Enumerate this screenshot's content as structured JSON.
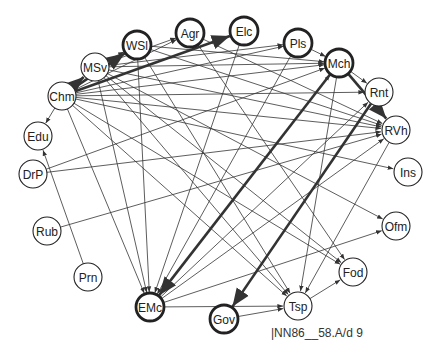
{
  "caption": "|NN86__58.A/d 9",
  "nodes": [
    {
      "id": "Chm",
      "x": 62,
      "y": 96,
      "bold": false
    },
    {
      "id": "MSv",
      "x": 95,
      "y": 67,
      "bold": false
    },
    {
      "id": "WSl",
      "x": 137,
      "y": 45,
      "bold": true
    },
    {
      "id": "Agr",
      "x": 190,
      "y": 33,
      "bold": true
    },
    {
      "id": "Elc",
      "x": 244,
      "y": 31,
      "bold": true
    },
    {
      "id": "Pls",
      "x": 298,
      "y": 43,
      "bold": true
    },
    {
      "id": "Mch",
      "x": 339,
      "y": 63,
      "bold": true
    },
    {
      "id": "Rnt",
      "x": 379,
      "y": 92,
      "bold": false
    },
    {
      "id": "RVh",
      "x": 396,
      "y": 130,
      "bold": false
    },
    {
      "id": "Ins",
      "x": 408,
      "y": 172,
      "bold": false
    },
    {
      "id": "Ofm",
      "x": 396,
      "y": 226,
      "bold": false
    },
    {
      "id": "Fod",
      "x": 353,
      "y": 272,
      "bold": false
    },
    {
      "id": "Tsp",
      "x": 298,
      "y": 306,
      "bold": false
    },
    {
      "id": "Gov",
      "x": 224,
      "y": 319,
      "bold": true
    },
    {
      "id": "EMc",
      "x": 150,
      "y": 307,
      "bold": true
    },
    {
      "id": "Prn",
      "x": 88,
      "y": 277,
      "bold": false
    },
    {
      "id": "Rub",
      "x": 47,
      "y": 231,
      "bold": false
    },
    {
      "id": "DrP",
      "x": 33,
      "y": 174,
      "bold": false
    },
    {
      "id": "Edu",
      "x": 38,
      "y": 136,
      "bold": false
    }
  ],
  "edges": [
    {
      "from": "Chm",
      "to": "MSv",
      "bold": true
    },
    {
      "from": "Chm",
      "to": "WSl",
      "bold": true
    },
    {
      "from": "Chm",
      "to": "Elc",
      "bold": true
    },
    {
      "from": "Chm",
      "to": "Agr",
      "bold": false
    },
    {
      "from": "Chm",
      "to": "Pls",
      "bold": false
    },
    {
      "from": "Chm",
      "to": "Mch",
      "bold": false
    },
    {
      "from": "Chm",
      "to": "Rnt",
      "bold": false
    },
    {
      "from": "Chm",
      "to": "RVh",
      "bold": false
    },
    {
      "from": "Chm",
      "to": "Ins",
      "bold": false
    },
    {
      "from": "Chm",
      "to": "Fod",
      "bold": false
    },
    {
      "from": "Chm",
      "to": "Tsp",
      "bold": false
    },
    {
      "from": "Chm",
      "to": "EMc",
      "bold": false
    },
    {
      "from": "Chm",
      "to": "Edu",
      "bold": false
    },
    {
      "from": "MSv",
      "to": "WSl",
      "bold": false
    },
    {
      "from": "MSv",
      "to": "Agr",
      "bold": false
    },
    {
      "from": "MSv",
      "to": "Pls",
      "bold": false
    },
    {
      "from": "MSv",
      "to": "Mch",
      "bold": false
    },
    {
      "from": "MSv",
      "to": "RVh",
      "bold": false
    },
    {
      "from": "MSv",
      "to": "Ofm",
      "bold": false
    },
    {
      "from": "MSv",
      "to": "Fod",
      "bold": false
    },
    {
      "from": "MSv",
      "to": "Tsp",
      "bold": false
    },
    {
      "from": "MSv",
      "to": "EMc",
      "bold": false
    },
    {
      "from": "WSl",
      "to": "Mch",
      "bold": false
    },
    {
      "from": "WSl",
      "to": "RVh",
      "bold": false
    },
    {
      "from": "WSl",
      "to": "Tsp",
      "bold": false
    },
    {
      "from": "WSl",
      "to": "EMc",
      "bold": false
    },
    {
      "from": "Agr",
      "to": "RVh",
      "bold": false
    },
    {
      "from": "Agr",
      "to": "Fod",
      "bold": false
    },
    {
      "from": "Elc",
      "to": "EMc",
      "bold": false
    },
    {
      "from": "Pls",
      "to": "Mch",
      "bold": false
    },
    {
      "from": "Pls",
      "to": "EMc",
      "bold": false
    },
    {
      "from": "Mch",
      "to": "RVh",
      "bold": true
    },
    {
      "from": "Mch",
      "to": "Rnt",
      "bold": false
    },
    {
      "from": "Mch",
      "to": "EMc",
      "bold": true
    },
    {
      "from": "Mch",
      "to": "Tsp",
      "bold": false
    },
    {
      "from": "Rnt",
      "to": "Gov",
      "bold": true
    },
    {
      "from": "RVh",
      "to": "Tsp",
      "bold": false
    },
    {
      "from": "DrP",
      "to": "RVh",
      "bold": false
    },
    {
      "from": "DrP",
      "to": "Mch",
      "bold": false
    },
    {
      "from": "Rub",
      "to": "RVh",
      "bold": false
    },
    {
      "from": "Prn",
      "to": "Edu",
      "bold": false
    },
    {
      "from": "EMc",
      "to": "Tsp",
      "bold": false
    },
    {
      "from": "EMc",
      "to": "RVh",
      "bold": false
    },
    {
      "from": "EMc",
      "to": "Rnt",
      "bold": false
    },
    {
      "from": "EMc",
      "to": "Ofm",
      "bold": false
    },
    {
      "from": "EMc",
      "to": "Mch",
      "bold": false
    },
    {
      "from": "Gov",
      "to": "Tsp",
      "bold": false
    },
    {
      "from": "Tsp",
      "to": "Fod",
      "bold": false
    }
  ],
  "colors": {
    "edge": "#333333",
    "node_stroke": "#222222",
    "node_fill": "#ffffff",
    "background": "#ffffff"
  }
}
